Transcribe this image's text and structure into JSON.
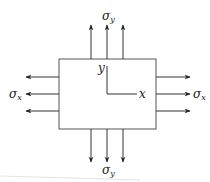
{
  "diagram": {
    "labels": {
      "sigma_y_top": "σ",
      "sigma_y_top_sub": "y",
      "sigma_y_bottom": "σ",
      "sigma_y_bottom_sub": "y",
      "sigma_x_left": "σ",
      "sigma_x_left_sub": "x",
      "sigma_x_right": "σ",
      "sigma_x_right_sub": "x",
      "axis_x": "x",
      "axis_y": "y"
    },
    "colors": {
      "line": "#333333",
      "box": "#555555",
      "faint_line": "#dddddd"
    }
  }
}
